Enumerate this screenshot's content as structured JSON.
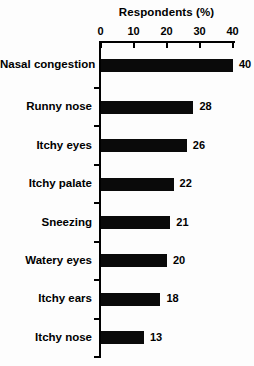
{
  "chart_data": {
    "type": "bar",
    "orientation": "horizontal",
    "title": "Respondents (%)",
    "xlabel": "Respondents (%)",
    "ylabel": "",
    "categories": [
      "Nasal congestion",
      "Runny nose",
      "Itchy eyes",
      "Itchy palate",
      "Sneezing",
      "Watery eyes",
      "Itchy ears",
      "Itchy nose"
    ],
    "values": [
      40,
      28,
      26,
      22,
      21,
      20,
      18,
      13
    ],
    "value_labels": [
      "40",
      "28",
      "26",
      "22",
      "21",
      "20",
      "18",
      "13"
    ],
    "x_ticks": [
      0,
      10,
      20,
      30,
      40
    ],
    "x_tick_labels": [
      "0",
      "10",
      "20",
      "30",
      "40"
    ],
    "xlim": [
      0,
      40
    ],
    "bar_color": "#0a0a0a",
    "text_color": "#000000",
    "background_color": "#fdfdfd",
    "grid": false,
    "legend_position": "none"
  }
}
